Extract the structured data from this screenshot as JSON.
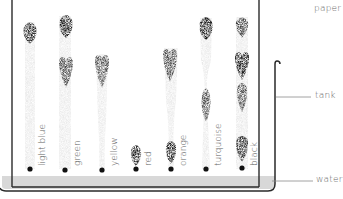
{
  "diagram": {
    "title": "",
    "callouts": {
      "paper": "paper",
      "tank": "tank",
      "water": "water"
    },
    "strips": [
      {
        "label": "light blue",
        "x": 30
      },
      {
        "label": "green",
        "x": 65
      },
      {
        "label": "yellow",
        "x": 102
      },
      {
        "label": "red",
        "x": 136
      },
      {
        "label": "orange",
        "x": 171
      },
      {
        "label": "turquoise",
        "x": 206
      },
      {
        "label": "black",
        "x": 242
      }
    ],
    "colors": {
      "line": "#2a2a2a",
      "water": "#d9d9d9",
      "strip": "#e6e6e6",
      "ink": "#1e1e1e",
      "text": "#6b6b6b"
    }
  }
}
